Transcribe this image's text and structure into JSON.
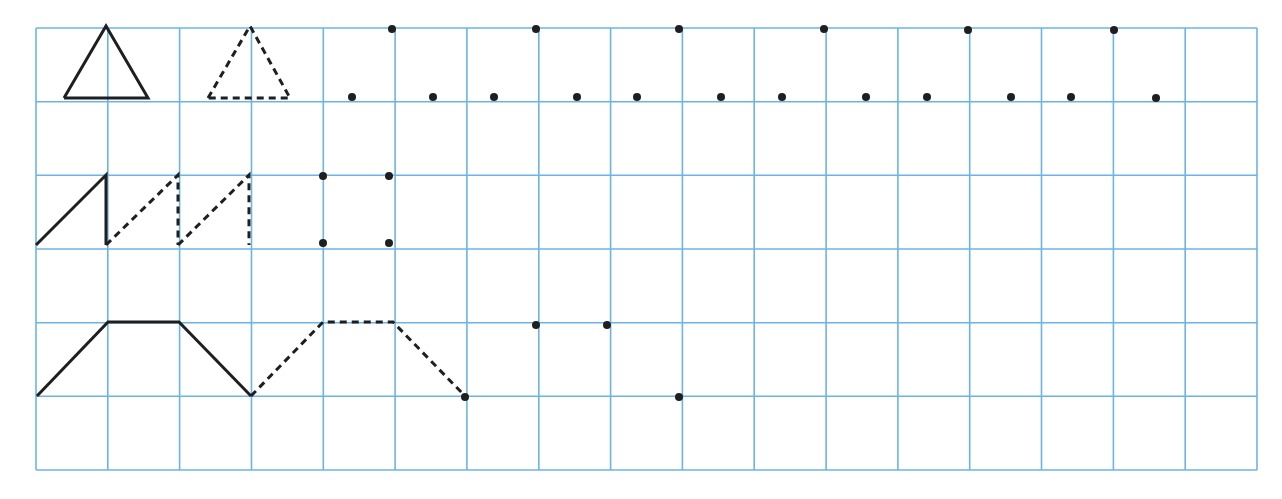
{
  "worksheet": {
    "title": "Continue the pattern on the grid",
    "colors": {
      "grid": "#6cb4e4",
      "ink": "#1f1f1f",
      "background": "#ffffff"
    },
    "grid": {
      "left": 36,
      "top": 28,
      "right": 1257,
      "bottom": 470,
      "cols": 17,
      "rows": 6
    },
    "rows": [
      {
        "id": "triangles",
        "solid_paths": [
          [
            [
              64,
              98
            ],
            [
              106,
              26
            ],
            [
              148,
              98
            ],
            [
              64,
              98
            ]
          ]
        ],
        "dashed_paths": [
          [
            [
              208,
              98
            ],
            [
              250,
              26
            ],
            [
              290,
              98
            ],
            [
              208,
              98
            ]
          ]
        ],
        "dots": [
          [
            392,
            29
          ],
          [
            352,
            97
          ],
          [
            433,
            97
          ],
          [
            536,
            29
          ],
          [
            494,
            97
          ],
          [
            577,
            97
          ],
          [
            679,
            29
          ],
          [
            637,
            97
          ],
          [
            721,
            97
          ],
          [
            824,
            29
          ],
          [
            782,
            97
          ],
          [
            866,
            97
          ],
          [
            968,
            30
          ],
          [
            927,
            97
          ],
          [
            1011,
            97
          ],
          [
            1114,
            30
          ],
          [
            1071,
            97
          ],
          [
            1156,
            98
          ]
        ]
      },
      {
        "id": "sawtooth",
        "solid_paths": [
          [
            [
              36,
              245
            ],
            [
              106,
              175
            ],
            [
              106,
              245
            ]
          ]
        ],
        "dashed_paths": [
          [
            [
              106,
              245
            ],
            [
              178,
              175
            ],
            [
              178,
              245
            ]
          ],
          [
            [
              178,
              245
            ],
            [
              249,
              175
            ],
            [
              249,
              245
            ]
          ]
        ],
        "dots": [
          [
            323,
            176
          ],
          [
            389,
            176
          ],
          [
            323,
            243
          ],
          [
            389,
            243
          ]
        ]
      },
      {
        "id": "trapezoid",
        "solid_paths": [
          [
            [
              37,
              396
            ],
            [
              108,
              322
            ],
            [
              179,
              322
            ],
            [
              251,
              396
            ]
          ]
        ],
        "dashed_paths": [
          [
            [
              251,
              396
            ],
            [
              323,
              322
            ],
            [
              393,
              322
            ],
            [
              465,
              396
            ]
          ]
        ],
        "dots": [
          [
            465,
            397
          ],
          [
            536,
            325
          ],
          [
            607,
            325
          ],
          [
            679,
            397
          ]
        ]
      }
    ]
  }
}
